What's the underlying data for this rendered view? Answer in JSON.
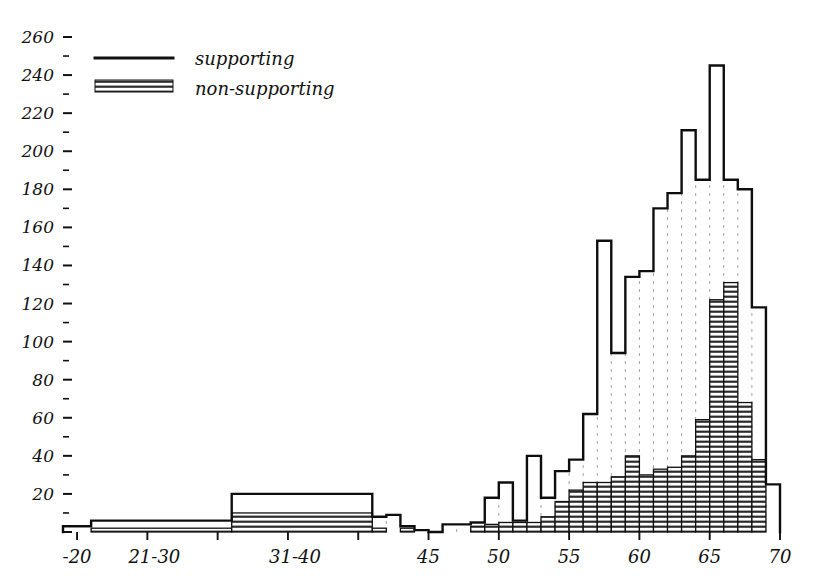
{
  "chart_data": {
    "type": "bar",
    "title": "",
    "subtitle": "",
    "xlabel": "",
    "ylabel": "",
    "xlim": [
      19,
      70
    ],
    "ylim": [
      0,
      260
    ],
    "grid": false,
    "legend_position": "top-left",
    "y_ticks": [
      0,
      20,
      40,
      60,
      80,
      100,
      120,
      140,
      160,
      180,
      200,
      220,
      240,
      260
    ],
    "y_tick_labels": [
      "",
      "20",
      "40",
      "60",
      "80",
      "100",
      "120",
      "140",
      "160",
      "180",
      "200",
      "220",
      "240",
      "260"
    ],
    "y_minor_step": 10,
    "x_ticks": [
      20,
      25,
      30,
      35,
      40,
      45,
      50,
      55,
      60,
      65,
      70
    ],
    "x_tick_labels": [
      {
        "value": 20,
        "text": "-20"
      },
      {
        "value": 25.5,
        "text": "21-30"
      },
      {
        "value": 35.5,
        "text": "31-40"
      },
      {
        "value": 45,
        "text": "45"
      },
      {
        "value": 50,
        "text": "50"
      },
      {
        "value": 55,
        "text": "55"
      },
      {
        "value": 60,
        "text": "60"
      },
      {
        "value": 65,
        "text": "65"
      },
      {
        "value": 70,
        "text": "70"
      }
    ],
    "series": [
      {
        "name": "supporting",
        "style": "outline",
        "color": "#111111"
      },
      {
        "name": "non-supporting",
        "style": "horizontal-hatch",
        "color": "#111111"
      }
    ],
    "bins": [
      {
        "x0": 19.0,
        "x1": 21.0,
        "total": 3,
        "non_supporting": 0
      },
      {
        "x0": 21.0,
        "x1": 31.0,
        "total": 6,
        "non_supporting": 2
      },
      {
        "x0": 31.0,
        "x1": 41.0,
        "total": 20,
        "non_supporting": 10
      },
      {
        "x0": 41.0,
        "x1": 42.0,
        "total": 8,
        "non_supporting": 2
      },
      {
        "x0": 42.0,
        "x1": 43.0,
        "total": 9,
        "non_supporting": 0
      },
      {
        "x0": 43.0,
        "x1": 44.0,
        "total": 3,
        "non_supporting": 2
      },
      {
        "x0": 44.0,
        "x1": 45.0,
        "total": 1,
        "non_supporting": 0
      },
      {
        "x0": 45.0,
        "x1": 46.0,
        "total": 0,
        "non_supporting": 0
      },
      {
        "x0": 46.0,
        "x1": 47.0,
        "total": 4,
        "non_supporting": 0
      },
      {
        "x0": 47.0,
        "x1": 48.0,
        "total": 4,
        "non_supporting": 0
      },
      {
        "x0": 48.0,
        "x1": 49.0,
        "total": 5,
        "non_supporting": 3
      },
      {
        "x0": 49.0,
        "x1": 50.0,
        "total": 18,
        "non_supporting": 4
      },
      {
        "x0": 50.0,
        "x1": 51.0,
        "total": 26,
        "non_supporting": 5
      },
      {
        "x0": 51.0,
        "x1": 52.0,
        "total": 6,
        "non_supporting": 5
      },
      {
        "x0": 52.0,
        "x1": 53.0,
        "total": 40,
        "non_supporting": 5
      },
      {
        "x0": 53.0,
        "x1": 54.0,
        "total": 18,
        "non_supporting": 8
      },
      {
        "x0": 54.0,
        "x1": 55.0,
        "total": 32,
        "non_supporting": 16
      },
      {
        "x0": 55.0,
        "x1": 56.0,
        "total": 38,
        "non_supporting": 22
      },
      {
        "x0": 56.0,
        "x1": 57.0,
        "total": 62,
        "non_supporting": 26
      },
      {
        "x0": 57.0,
        "x1": 58.0,
        "total": 153,
        "non_supporting": 26
      },
      {
        "x0": 58.0,
        "x1": 59.0,
        "total": 94,
        "non_supporting": 29
      },
      {
        "x0": 59.0,
        "x1": 60.0,
        "total": 134,
        "non_supporting": 40
      },
      {
        "x0": 60.0,
        "x1": 61.0,
        "total": 137,
        "non_supporting": 30
      },
      {
        "x0": 61.0,
        "x1": 62.0,
        "total": 170,
        "non_supporting": 33
      },
      {
        "x0": 62.0,
        "x1": 63.0,
        "total": 178,
        "non_supporting": 34
      },
      {
        "x0": 63.0,
        "x1": 64.0,
        "total": 211,
        "non_supporting": 40
      },
      {
        "x0": 64.0,
        "x1": 65.0,
        "total": 185,
        "non_supporting": 59
      },
      {
        "x0": 65.0,
        "x1": 66.0,
        "total": 245,
        "non_supporting": 122
      },
      {
        "x0": 66.0,
        "x1": 67.0,
        "total": 185,
        "non_supporting": 131
      },
      {
        "x0": 67.0,
        "x1": 68.0,
        "total": 180,
        "non_supporting": 68
      },
      {
        "x0": 68.0,
        "x1": 69.0,
        "total": 118,
        "non_supporting": 38
      },
      {
        "x0": 69.0,
        "x1": 70.0,
        "total": 25,
        "non_supporting": 0
      }
    ]
  },
  "legend": {
    "items": [
      {
        "label": "supporting",
        "swatch": "solid-line-swatch"
      },
      {
        "label": "non-supporting",
        "swatch": "hatched-swatch"
      }
    ]
  },
  "colors": {
    "ink": "#111111",
    "background": "#ffffff",
    "hatch": "#2a2a2a"
  }
}
